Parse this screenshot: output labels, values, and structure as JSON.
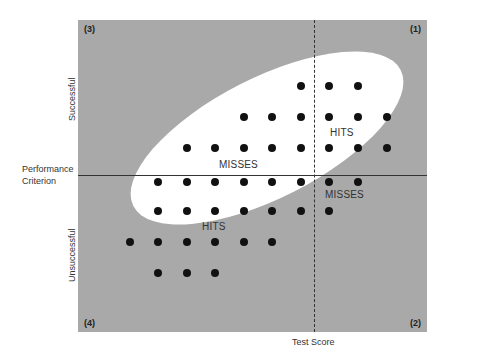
{
  "diagram": {
    "x_axis_label": "Test Score",
    "y_axis_label_line1": "Performance",
    "y_axis_label_line2": "Criterion",
    "y_upper_label": "Successful",
    "y_lower_label": "Unsuccessful",
    "quadrants": {
      "q1": "(1)",
      "q2": "(2)",
      "q3": "(3)",
      "q4": "(4)"
    },
    "regions": {
      "upper_right": "HITS",
      "upper_left": "MISSES",
      "lower_right": "MISSES",
      "lower_left": "HITS"
    },
    "colors": {
      "background": "#a9a9a9",
      "ellipse": "#ffffff",
      "dots": "#111111"
    },
    "dots": [
      [
        301,
        86
      ],
      [
        329,
        86
      ],
      [
        358,
        86
      ],
      [
        244,
        117
      ],
      [
        272,
        117
      ],
      [
        301,
        117
      ],
      [
        329,
        117
      ],
      [
        358,
        117
      ],
      [
        387,
        117
      ],
      [
        187,
        148
      ],
      [
        215,
        148
      ],
      [
        244,
        148
      ],
      [
        272,
        148
      ],
      [
        301,
        148
      ],
      [
        329,
        148
      ],
      [
        358,
        148
      ],
      [
        387,
        148
      ],
      [
        158,
        182
      ],
      [
        187,
        182
      ],
      [
        215,
        182
      ],
      [
        244,
        182
      ],
      [
        272,
        182
      ],
      [
        301,
        182
      ],
      [
        329,
        182
      ],
      [
        358,
        182
      ],
      [
        158,
        211
      ],
      [
        187,
        211
      ],
      [
        215,
        211
      ],
      [
        244,
        211
      ],
      [
        272,
        211
      ],
      [
        301,
        211
      ],
      [
        329,
        211
      ],
      [
        130,
        242
      ],
      [
        158,
        242
      ],
      [
        187,
        242
      ],
      [
        215,
        242
      ],
      [
        244,
        242
      ],
      [
        272,
        242
      ],
      [
        158,
        273
      ],
      [
        187,
        273
      ],
      [
        215,
        273
      ]
    ]
  }
}
